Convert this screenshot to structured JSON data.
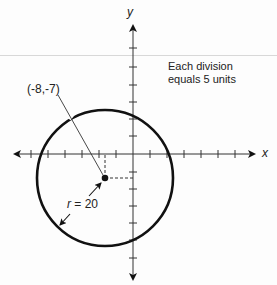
{
  "diagram": {
    "type": "coordinate-plane-circle",
    "axes": {
      "x_label": "x",
      "y_label": "y",
      "division_value": 5,
      "x_ticks_negative": 5,
      "x_ticks_positive": 6,
      "y_ticks_positive": 6,
      "y_ticks_negative": 6
    },
    "note": {
      "line1": "Each division",
      "line2": "equals 5 units"
    },
    "circle": {
      "center_label": "(-8,-7)",
      "center": [
        -8,
        -7
      ],
      "radius_symbol": "r",
      "radius_text": " = 20",
      "radius": 20
    },
    "colors": {
      "ink": "#111111",
      "background": "#fdfdfd"
    }
  }
}
